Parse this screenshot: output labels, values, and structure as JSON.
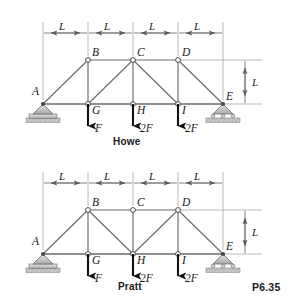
{
  "figure": {
    "problem_number": "P6.35",
    "background_color": "#ffffff",
    "line_color": "#5a5a5a",
    "member_color": "#6b6b6b",
    "text_color": "#1a1a1a",
    "support_fill": "#c8c8c8",
    "arrow_color": "#111111"
  },
  "trusses": [
    {
      "id": "howe",
      "caption": "Howe",
      "top_dimensions": [
        {
          "label": "L"
        },
        {
          "label": "L"
        },
        {
          "label": "L"
        },
        {
          "label": "L"
        }
      ],
      "height_dimension": {
        "label": "L"
      },
      "joints": [
        {
          "name": "A",
          "label": "A",
          "x": 43,
          "y": 104,
          "label_dx": -11,
          "label_dy": -10,
          "node_marker": false
        },
        {
          "name": "B",
          "label": "B",
          "x": 88,
          "y": 60,
          "label_dx": 4,
          "label_dy": -4,
          "node_marker": true
        },
        {
          "name": "C",
          "label": "C",
          "x": 133,
          "y": 60,
          "label_dx": 4,
          "label_dy": -4,
          "node_marker": true
        },
        {
          "name": "D",
          "label": "D",
          "x": 178,
          "y": 60,
          "label_dx": 4,
          "label_dy": -4,
          "node_marker": true
        },
        {
          "name": "E",
          "label": "E",
          "x": 223,
          "y": 104,
          "label_dx": 3,
          "label_dy": -5,
          "node_marker": false
        },
        {
          "name": "G",
          "label": "G",
          "x": 88,
          "y": 104,
          "label_dx": 4,
          "label_dy": 9,
          "node_marker": true
        },
        {
          "name": "H",
          "label": "H",
          "x": 133,
          "y": 104,
          "label_dx": 4,
          "label_dy": 9,
          "node_marker": true
        },
        {
          "name": "I",
          "label": "I",
          "x": 178,
          "y": 104,
          "label_dx": 4,
          "label_dy": 9,
          "node_marker": true
        }
      ],
      "members": [
        {
          "from": "A",
          "to": "B",
          "kind": "diagonal"
        },
        {
          "from": "B",
          "to": "C",
          "kind": "top-chord"
        },
        {
          "from": "C",
          "to": "D",
          "kind": "top-chord"
        },
        {
          "from": "D",
          "to": "E",
          "kind": "diagonal"
        },
        {
          "from": "A",
          "to": "G",
          "kind": "bottom-chord"
        },
        {
          "from": "G",
          "to": "H",
          "kind": "bottom-chord"
        },
        {
          "from": "H",
          "to": "I",
          "kind": "bottom-chord"
        },
        {
          "from": "I",
          "to": "E",
          "kind": "bottom-chord"
        },
        {
          "from": "B",
          "to": "G",
          "kind": "vertical"
        },
        {
          "from": "C",
          "to": "H",
          "kind": "vertical"
        },
        {
          "from": "D",
          "to": "I",
          "kind": "vertical"
        },
        {
          "from": "C",
          "to": "G",
          "kind": "diagonal"
        },
        {
          "from": "C",
          "to": "I",
          "kind": "diagonal"
        }
      ],
      "loads": [
        {
          "at": "G",
          "label": "F"
        },
        {
          "at": "H",
          "label": "2F"
        },
        {
          "at": "I",
          "label": "2F"
        }
      ],
      "supports": [
        {
          "at": "A",
          "type": "pin"
        },
        {
          "at": "E",
          "type": "roller"
        }
      ]
    },
    {
      "id": "pratt",
      "caption": "Pratt",
      "top_dimensions": [
        {
          "label": "L"
        },
        {
          "label": "L"
        },
        {
          "label": "L"
        },
        {
          "label": "L"
        }
      ],
      "height_dimension": {
        "label": "L"
      },
      "joints": [
        {
          "name": "A",
          "label": "A",
          "x": 43,
          "y": 104,
          "label_dx": -11,
          "label_dy": -10,
          "node_marker": false
        },
        {
          "name": "B",
          "label": "B",
          "x": 88,
          "y": 60,
          "label_dx": 4,
          "label_dy": -4,
          "node_marker": true
        },
        {
          "name": "C",
          "label": "C",
          "x": 133,
          "y": 60,
          "label_dx": 4,
          "label_dy": -4,
          "node_marker": true
        },
        {
          "name": "D",
          "label": "D",
          "x": 178,
          "y": 60,
          "label_dx": 4,
          "label_dy": -4,
          "node_marker": true
        },
        {
          "name": "E",
          "label": "E",
          "x": 223,
          "y": 104,
          "label_dx": 3,
          "label_dy": -5,
          "node_marker": false
        },
        {
          "name": "G",
          "label": "G",
          "x": 88,
          "y": 104,
          "label_dx": 4,
          "label_dy": 9,
          "node_marker": true
        },
        {
          "name": "H",
          "label": "H",
          "x": 133,
          "y": 104,
          "label_dx": 4,
          "label_dy": 9,
          "node_marker": true
        },
        {
          "name": "I",
          "label": "I",
          "x": 178,
          "y": 104,
          "label_dx": 4,
          "label_dy": 9,
          "node_marker": true
        }
      ],
      "members": [
        {
          "from": "A",
          "to": "B",
          "kind": "diagonal"
        },
        {
          "from": "B",
          "to": "C",
          "kind": "top-chord"
        },
        {
          "from": "C",
          "to": "D",
          "kind": "top-chord"
        },
        {
          "from": "D",
          "to": "E",
          "kind": "diagonal"
        },
        {
          "from": "A",
          "to": "G",
          "kind": "bottom-chord"
        },
        {
          "from": "G",
          "to": "H",
          "kind": "bottom-chord"
        },
        {
          "from": "H",
          "to": "I",
          "kind": "bottom-chord"
        },
        {
          "from": "I",
          "to": "E",
          "kind": "bottom-chord"
        },
        {
          "from": "B",
          "to": "G",
          "kind": "vertical"
        },
        {
          "from": "C",
          "to": "H",
          "kind": "vertical"
        },
        {
          "from": "D",
          "to": "I",
          "kind": "vertical"
        },
        {
          "from": "B",
          "to": "H",
          "kind": "diagonal"
        },
        {
          "from": "D",
          "to": "H",
          "kind": "diagonal"
        }
      ],
      "loads": [
        {
          "at": "G",
          "label": "F"
        },
        {
          "at": "H",
          "label": "2F"
        },
        {
          "at": "I",
          "label": "2F"
        }
      ],
      "supports": [
        {
          "at": "A",
          "type": "pin"
        },
        {
          "at": "E",
          "type": "roller"
        }
      ]
    }
  ]
}
